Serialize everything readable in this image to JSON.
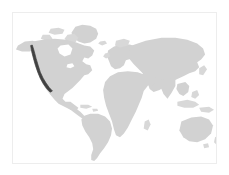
{
  "figure": {
    "type": "world-map-thumbnail",
    "title": "",
    "width_px": 229,
    "height_px": 175,
    "background_color": "#ffffff",
    "frame": {
      "visible": true,
      "border_color": "#ededed",
      "left_px": 12,
      "top_px": 12,
      "width_px": 205,
      "height_px": 152
    }
  },
  "map": {
    "projection": "equirectangular",
    "land_color": "#d2d2d2",
    "ocean_color": "#ffffff",
    "highlight_color": "#414141",
    "labels_visible": false,
    "graticule_visible": false,
    "legend_visible": false,
    "continents": [
      {
        "name": "North America",
        "highlighted": false
      },
      {
        "name": "South America",
        "highlighted": false
      },
      {
        "name": "Europe",
        "highlighted": false
      },
      {
        "name": "Africa",
        "highlighted": false
      },
      {
        "name": "Asia",
        "highlighted": false
      },
      {
        "name": "Australia",
        "highlighted": false
      },
      {
        "name": "Greenland",
        "highlighted": false
      }
    ],
    "highlighted_regions": [
      {
        "name": "North American Pacific Coast",
        "description": "Narrow dark coastal strip along the western seaboard of North America",
        "color": "#414141",
        "bbox_px": {
          "x": 33,
          "y": 44,
          "width": 10,
          "height": 31
        }
      }
    ]
  }
}
